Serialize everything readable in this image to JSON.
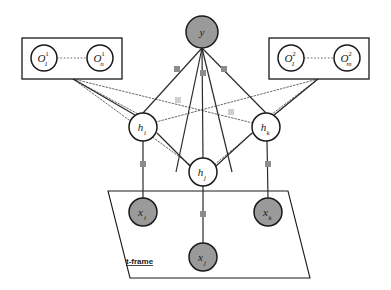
{
  "diagram": {
    "title": "t-frame",
    "colors": {
      "observed_node_fill": "#9a9a9a",
      "hidden_node_fill": "#ffffff",
      "node_stroke": "#1a1a1a",
      "edge_solid": "#2b2b2b",
      "edge_dotted": "#555555",
      "factor_square": "#8c8c8c",
      "factor_square_faded": "#cfcfcf",
      "frame_stroke": "#1a1a1a",
      "background": "#ffffff"
    },
    "nodes": {
      "output": {
        "id": "y",
        "label": "y",
        "sub": "",
        "sup": "",
        "type": "observed",
        "cx": 202,
        "cy": 32,
        "r": 16
      },
      "hidden": [
        {
          "id": "h_i",
          "label": "h",
          "sub": "i",
          "sup": "",
          "type": "hidden",
          "cx": 143,
          "cy": 127,
          "r": 14
        },
        {
          "id": "h_j",
          "label": "h",
          "sub": "j",
          "sup": "",
          "type": "hidden",
          "cx": 203,
          "cy": 172,
          "r": 14
        },
        {
          "id": "h_k",
          "label": "h",
          "sub": "k",
          "sup": "",
          "type": "hidden",
          "cx": 266,
          "cy": 127,
          "r": 14
        }
      ],
      "inputs": [
        {
          "id": "x_i",
          "label": "x",
          "sub": "i",
          "sup": "",
          "type": "observed",
          "cx": 143,
          "cy": 212,
          "r": 14
        },
        {
          "id": "x_j",
          "label": "x",
          "sub": "j",
          "sup": "",
          "type": "observed",
          "cx": 203,
          "cy": 257,
          "r": 14
        },
        {
          "id": "x_k",
          "label": "x",
          "sub": "k",
          "sup": "",
          "type": "observed",
          "cx": 268,
          "cy": 212,
          "r": 14
        }
      ],
      "observations_left": [
        {
          "id": "O_1_1",
          "label": "O",
          "sub": "1",
          "sup": "1",
          "type": "hidden",
          "cx": 44,
          "cy": 58,
          "r": 13
        },
        {
          "id": "O_n_1",
          "label": "O",
          "sub": "n",
          "sup": "1",
          "type": "hidden",
          "cx": 100,
          "cy": 58,
          "r": 13
        }
      ],
      "observations_right": [
        {
          "id": "O_1_2",
          "label": "O",
          "sub": "1",
          "sup": "2",
          "type": "hidden",
          "cx": 291,
          "cy": 58,
          "r": 13
        },
        {
          "id": "O_m_2",
          "label": "O",
          "sub": "m",
          "sup": "2",
          "type": "hidden",
          "cx": 347,
          "cy": 58,
          "r": 13
        }
      ]
    },
    "plates": {
      "left_box": {
        "x": 22,
        "y": 38,
        "w": 100,
        "h": 41
      },
      "right_box": {
        "x": 269,
        "y": 38,
        "w": 100,
        "h": 41
      },
      "t_frame": {
        "label": "t-frame",
        "label_x": 126,
        "label_y": 264,
        "points": "108,191 288,191 310,278 130,278"
      }
    },
    "factor_squares": [
      {
        "id": "f-y-left",
        "x": 174,
        "y": 66,
        "size": 6,
        "shade": "normal"
      },
      {
        "id": "f-y-mid",
        "x": 200,
        "y": 70,
        "size": 6,
        "shade": "normal"
      },
      {
        "id": "f-y-right",
        "x": 221,
        "y": 66,
        "size": 6,
        "shade": "normal"
      },
      {
        "id": "f-mid-left",
        "x": 175,
        "y": 97,
        "size": 6,
        "shade": "faded"
      },
      {
        "id": "f-mid-right",
        "x": 228,
        "y": 109,
        "size": 6,
        "shade": "faded"
      },
      {
        "id": "f-hi-xi",
        "x": 140,
        "y": 161,
        "size": 6,
        "shade": "normal"
      },
      {
        "id": "f-hk-xk",
        "x": 265,
        "y": 161,
        "size": 6,
        "shade": "normal"
      },
      {
        "id": "f-hj-xj",
        "x": 200,
        "y": 211,
        "size": 6,
        "shade": "normal"
      }
    ],
    "edges_solid": [
      {
        "id": "y-hi",
        "x1": 202,
        "y1": 48,
        "x2": 143,
        "y2": 113
      },
      {
        "id": "y-hj",
        "x1": 202,
        "y1": 48,
        "x2": 203,
        "y2": 158
      },
      {
        "id": "y-hk",
        "x1": 202,
        "y1": 48,
        "x2": 266,
        "y2": 113
      },
      {
        "id": "y-mid1",
        "x1": 202,
        "y1": 48,
        "x2": 176,
        "y2": 172
      },
      {
        "id": "y-mid2",
        "x1": 202,
        "y1": 48,
        "x2": 232,
        "y2": 172
      },
      {
        "id": "hi-hj",
        "x1": 157,
        "y1": 133,
        "x2": 190,
        "y2": 166
      },
      {
        "id": "hk-hj",
        "x1": 252,
        "y1": 133,
        "x2": 216,
        "y2": 166
      },
      {
        "id": "hi-xi",
        "x1": 143,
        "y1": 141,
        "x2": 143,
        "y2": 198
      },
      {
        "id": "hk-xk",
        "x1": 267,
        "y1": 141,
        "x2": 268,
        "y2": 198
      },
      {
        "id": "hj-xj",
        "x1": 203,
        "y1": 186,
        "x2": 203,
        "y2": 243
      },
      {
        "id": "lbox-hi",
        "x1": 73,
        "y1": 79,
        "x2": 135,
        "y2": 115
      },
      {
        "id": "rbox-hk",
        "x1": 318,
        "y1": 79,
        "x2": 274,
        "y2": 115
      }
    ],
    "edges_dotted": [
      {
        "id": "lbox-hk",
        "x1": 73,
        "y1": 79,
        "x2": 253,
        "y2": 123
      },
      {
        "id": "lbox-hj",
        "x1": 73,
        "y1": 79,
        "x2": 192,
        "y2": 166
      },
      {
        "id": "lbox-hi2",
        "x1": 73,
        "y1": 79,
        "x2": 138,
        "y2": 114
      },
      {
        "id": "rbox-hi",
        "x1": 318,
        "y1": 79,
        "x2": 156,
        "y2": 122
      },
      {
        "id": "rbox-hj",
        "x1": 318,
        "y1": 79,
        "x2": 214,
        "y2": 165
      },
      {
        "id": "rbox-hk2",
        "x1": 318,
        "y1": 79,
        "x2": 272,
        "y2": 114
      },
      {
        "id": "o1-on",
        "x1": 57,
        "y1": 58,
        "x2": 87,
        "y2": 58
      },
      {
        "id": "o1-om",
        "x1": 304,
        "y1": 58,
        "x2": 334,
        "y2": 58
      }
    ]
  }
}
